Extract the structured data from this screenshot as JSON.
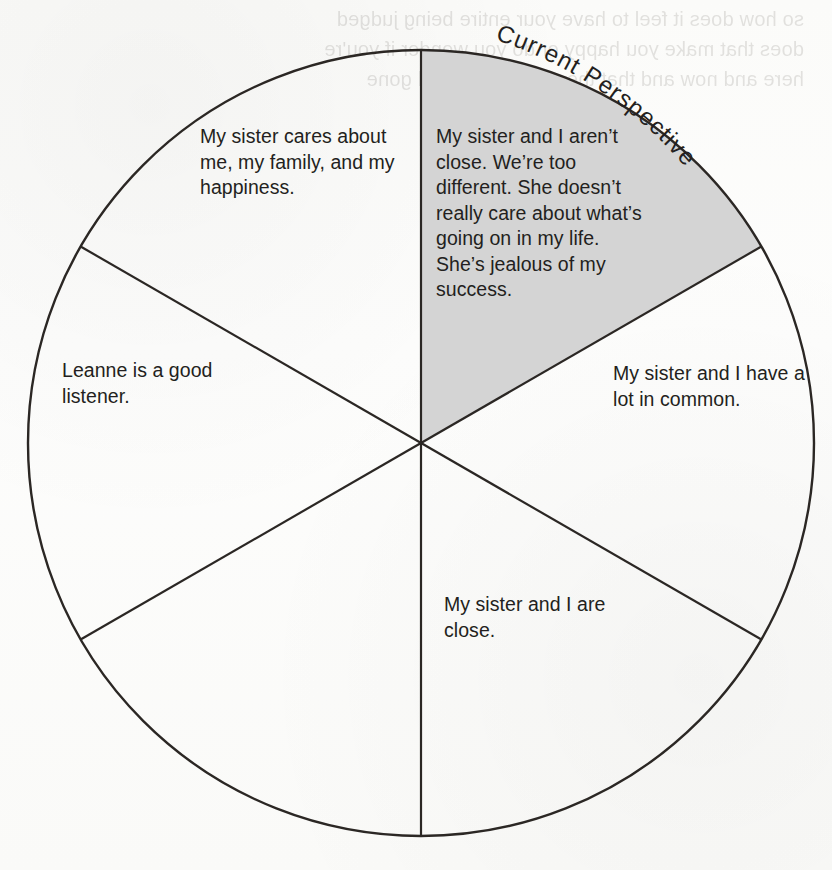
{
  "page": {
    "background_color": "#fdfdfc",
    "ink_color": "#231f20",
    "shaded_wedge_color": "#d4d4d4",
    "bleed_through_text": "so how does it feel to have your entire being judged\ndoes that make you happy or do you wonder if you're\nhere and now and that the past is past and gone"
  },
  "diagram": {
    "type": "wheel",
    "segment_count": 6,
    "callout_label": "Current Perspective",
    "center": {
      "x": 421,
      "y": 443
    },
    "radius": 393,
    "segments": [
      {
        "id": "segment-current",
        "position": "upper-right",
        "shaded": true,
        "text": "My sister and I aren’t close. We’re too different. She doesn’t really care about what’s going on in my life. She’s jealous of my success."
      },
      {
        "id": "segment-right",
        "position": "right",
        "shaded": false,
        "text": "My sister and I have a lot in common."
      },
      {
        "id": "segment-lower-right",
        "position": "lower-right",
        "shaded": false,
        "text": "My sister and I are close."
      },
      {
        "id": "segment-lower-left",
        "position": "lower-left",
        "shaded": false,
        "text": ""
      },
      {
        "id": "segment-left",
        "position": "left",
        "shaded": false,
        "text": "Leanne is a good listener."
      },
      {
        "id": "segment-upper-left",
        "position": "upper-left",
        "shaded": false,
        "text": "My sister cares about me, my family, and my happiness."
      }
    ]
  }
}
